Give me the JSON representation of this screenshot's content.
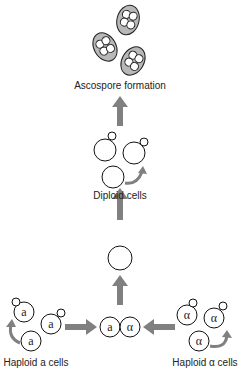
{
  "diagram": {
    "labels": {
      "ascospore": "Ascospore formation",
      "diploid": "Diploid cells",
      "haploid_a": "Haploid a cells",
      "haploid_alpha": "Haploid α cells"
    },
    "cell_letters": {
      "a": "a",
      "alpha": "α"
    },
    "colors": {
      "arrow": "#808080",
      "ascus_fill": "#b8b8b8",
      "stroke": "#111111"
    },
    "stages": [
      "Haploid a cells",
      "Haploid α cells",
      "Mating (a + α)",
      "Zygote",
      "Diploid cells",
      "Ascospore formation"
    ]
  }
}
